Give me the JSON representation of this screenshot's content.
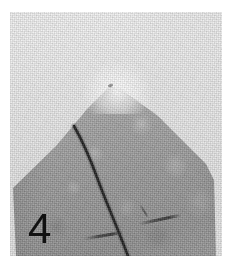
{
  "figure": {
    "panel_label": "4",
    "label_color": "#111111",
    "caption": "",
    "media_type": "grayscale-photograph",
    "canvas": {
      "width": 231,
      "height": 259,
      "background": "#ffffff"
    },
    "plate": {
      "left": 10,
      "top": 12,
      "width": 212,
      "height": 244
    }
  },
  "palette": {
    "page_background": "#ffffff",
    "photo_background_light": "#f2f2f2",
    "photo_background_mid": "#e6e6e6",
    "specimen_light": "#bdbdbd",
    "specimen_mid": "#a8a8a8",
    "specimen_dark": "#9a9a9a",
    "crack_line": "#161616",
    "mark_color": "#3a3a3a",
    "apex_highlight": "#ffffff"
  },
  "features": {
    "apex": {
      "name": "specimen-apex",
      "x": 100,
      "y": 76
    },
    "left_ridge_end": {
      "x": 3,
      "y": 176
    },
    "right_ridge_end": {
      "x": 204,
      "y": 168
    },
    "crack": {
      "name": "crack-line",
      "path": "M 64 114 C 72 128, 80 146, 88 168 C 96 190, 106 212, 118 244",
      "stroke_width": 2.6,
      "color": "#161616"
    },
    "marks": [
      {
        "name": "mark-lower-left",
        "x": 74,
        "y": 222,
        "length": 40,
        "angle": -9
      },
      {
        "name": "mark-right",
        "x": 128,
        "y": 206,
        "length": 44,
        "angle": -12
      },
      {
        "name": "mark-right-2",
        "x": 126,
        "y": 198,
        "length": 16,
        "angle": 58
      }
    ]
  },
  "icons": {
    "panel_label_glyph": "digit-four-glyph"
  }
}
